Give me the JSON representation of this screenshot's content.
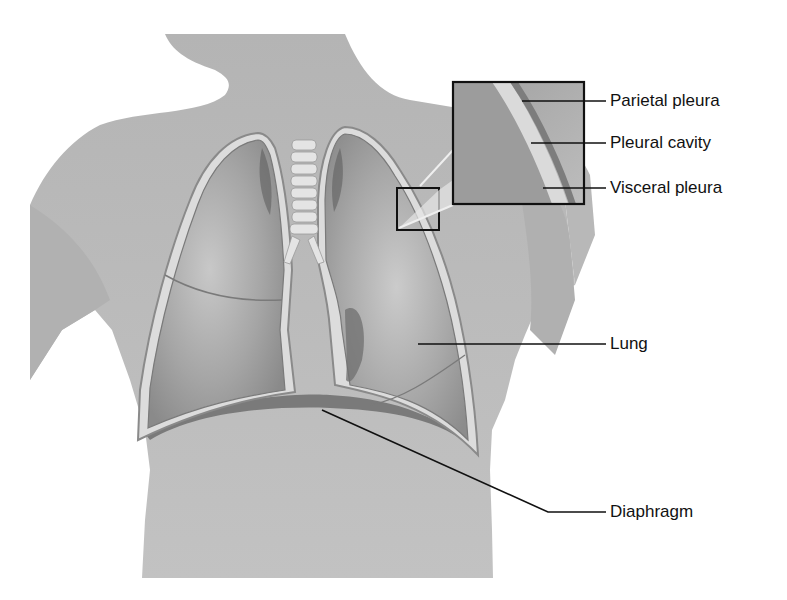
{
  "figure": {
    "colors": {
      "background": "#ffffff",
      "skin": "#bdbdbd",
      "lung": "#a9a9a9",
      "lung_dark": "#6f6f6f",
      "pleura_light": "#dcdcdc",
      "pleura_dark": "#8a8a8a",
      "leader_line": "#111111",
      "box": "#111111"
    },
    "labels": [
      {
        "id": "parietal-pleura",
        "text": "Parietal pleura"
      },
      {
        "id": "pleural-cavity",
        "text": "Pleural cavity"
      },
      {
        "id": "visceral-pleura",
        "text": "Visceral pleura"
      },
      {
        "id": "lung",
        "text": "Lung"
      },
      {
        "id": "diaphragm",
        "text": "Diaphragm"
      }
    ]
  }
}
